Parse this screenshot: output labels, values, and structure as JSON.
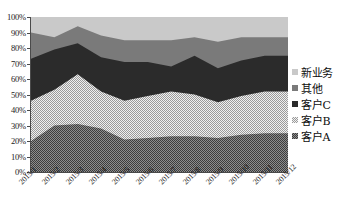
{
  "chart_data": {
    "type": "area",
    "stacked": true,
    "title": "",
    "subtitle": "",
    "xlabel": "",
    "ylabel": "",
    "grid": false,
    "legend_position": "right",
    "categories": [
      "2015/1",
      "2015/2",
      "2015/3",
      "2015/4",
      "2015/5",
      "2015/6",
      "2015/7",
      "2015/8",
      "2015/9",
      "2015/10",
      "2015/11",
      "2015/12"
    ],
    "ylim": [
      0,
      100
    ],
    "y_ticks": [
      "0%",
      "10%",
      "20%",
      "30%",
      "40%",
      "50%",
      "60%",
      "70%",
      "80%",
      "90%",
      "100%"
    ],
    "y_tick_values": [
      0,
      10,
      20,
      30,
      40,
      50,
      60,
      70,
      80,
      90,
      100
    ],
    "series": [
      {
        "name": "客户A",
        "key": "customer-a",
        "color": "#6b6b6b",
        "pattern": "checker-dark",
        "values": [
          20,
          30,
          31,
          28,
          21,
          22,
          23,
          23,
          22,
          24,
          25,
          25
        ]
      },
      {
        "name": "客户B",
        "key": "customer-b",
        "color": "#c4c4c4",
        "pattern": "checker-light",
        "values": [
          26,
          23,
          32,
          24,
          25,
          27,
          29,
          27,
          23,
          25,
          27,
          27
        ]
      },
      {
        "name": "客户C",
        "key": "customer-c",
        "color": "#2b2b2b",
        "pattern": "solid",
        "values": [
          27,
          26,
          20,
          22,
          25,
          22,
          16,
          25,
          22,
          23,
          23,
          23
        ]
      },
      {
        "name": "其他",
        "key": "other",
        "color": "#7a7a7a",
        "pattern": "solid",
        "values": [
          17,
          8,
          11,
          14,
          14,
          14,
          17,
          12,
          17,
          15,
          12,
          12
        ]
      },
      {
        "name": "新业务",
        "key": "new-business",
        "color": "#c9c9c9",
        "pattern": "solid",
        "values": [
          10,
          13,
          6,
          12,
          15,
          15,
          15,
          13,
          16,
          13,
          13,
          13
        ]
      }
    ],
    "cumulative": {
      "客户A": [
        20,
        30,
        31,
        28,
        21,
        22,
        23,
        23,
        22,
        24,
        25,
        25
      ],
      "客户B": [
        46,
        53,
        63,
        52,
        46,
        49,
        52,
        50,
        45,
        49,
        52,
        52
      ],
      "客户C": [
        73,
        79,
        83,
        74,
        71,
        71,
        68,
        75,
        67,
        72,
        75,
        75
      ],
      "其他": [
        90,
        87,
        94,
        88,
        85,
        85,
        85,
        87,
        84,
        87,
        87,
        87
      ],
      "新业务": [
        100,
        100,
        100,
        100,
        100,
        100,
        100,
        100,
        100,
        100,
        100,
        100
      ]
    }
  },
  "legend": {
    "items": [
      {
        "label": "新业务",
        "key": "new-business"
      },
      {
        "label": "其他",
        "key": "other"
      },
      {
        "label": "客户C",
        "key": "customer-c"
      },
      {
        "label": "客户B",
        "key": "customer-b"
      },
      {
        "label": "客户A",
        "key": "customer-a"
      }
    ]
  }
}
